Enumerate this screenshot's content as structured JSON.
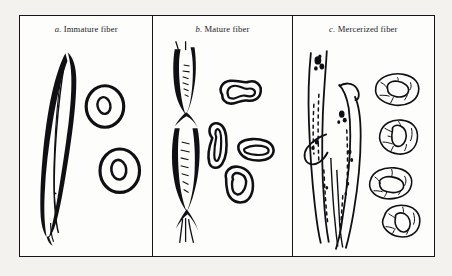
{
  "figure": {
    "background_color": "#f3f2ee",
    "plate_background": "#fdfdfb",
    "ink_color": "#101014",
    "border_color": "#16161a",
    "panel_count": 3
  },
  "panels": [
    {
      "id": "panel-a",
      "caption_letter": "a.",
      "caption_text": "Immature fiber",
      "caption_full": "a. Immature fiber",
      "longitudinal_view": {
        "name": "flat-ribbon-fiber",
        "description": "flat collapsed ribbon-like fiber with a thin central lumen line",
        "count": 1
      },
      "cross_sections": {
        "name": "oval-cross-section",
        "description": "thick-walled oval rings with small central lumen",
        "count": 2
      }
    },
    {
      "id": "panel-b",
      "caption_letter": "b.",
      "caption_text": "Mature fiber",
      "caption_full": "b. Mature fiber",
      "longitudinal_view": {
        "name": "convoluted-twisted-fiber",
        "description": "twisted convoluted ribbon with crossover points and hatched shading",
        "count": 1
      },
      "cross_sections": {
        "name": "kidney-bean-cross-section",
        "description": "kidney and bean shaped sections with elongated slit lumens",
        "count": 4
      }
    },
    {
      "id": "panel-c",
      "caption_letter": "c.",
      "caption_text": "Mercerized fiber",
      "caption_full": "c. Mercerized fiber",
      "longitudinal_view": {
        "name": "swollen-cylindrical-fiber",
        "description": "swollen rod-like fibers with surface striations and speckled marks",
        "count": 2
      },
      "cross_sections": {
        "name": "rounded-swollen-cross-section",
        "description": "rounded irregular swollen sections with internal texture lines",
        "count": 4
      }
    }
  ]
}
